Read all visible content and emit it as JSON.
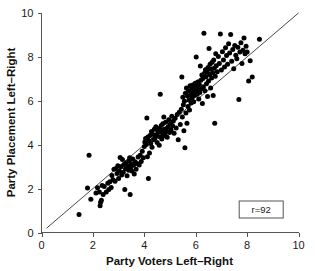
{
  "chart_data": {
    "type": "scatter",
    "title": "",
    "xlabel": "Party Voters Left–Right",
    "ylabel": "Party Placement Left–Right",
    "xlim": [
      0,
      10
    ],
    "ylim": [
      0,
      10
    ],
    "xticks": [
      0,
      2,
      4,
      6,
      8,
      10
    ],
    "yticks": [
      0,
      2,
      4,
      6,
      8,
      10
    ],
    "xtick_labels": [
      "0",
      "2",
      "4",
      "6",
      "8",
      "10"
    ],
    "ytick_labels": [
      "0",
      "2",
      "4",
      "6",
      "8",
      "10"
    ],
    "grid": false,
    "legend": null,
    "annotations": [
      {
        "name": "correlation-box",
        "text": "r=92",
        "x": 8.55,
        "y": 1.05,
        "boxed": true
      }
    ],
    "reference_line": {
      "type": "identity",
      "description": "45-degree diagonal reference line y = x",
      "x_start": 0.2,
      "y_start": 0.2,
      "x_end": 10.0,
      "y_end": 10.0
    },
    "marker": {
      "shape": "circle",
      "color": "#000000",
      "size_px": 5
    },
    "n_points": 214,
    "points": [
      [
        1.46,
        0.82
      ],
      [
        1.79,
        2.03
      ],
      [
        1.85,
        3.52
      ],
      [
        1.92,
        1.52
      ],
      [
        2.12,
        1.8
      ],
      [
        2.18,
        2.04
      ],
      [
        2.25,
        1.84
      ],
      [
        2.28,
        1.22
      ],
      [
        2.3,
        1.38
      ],
      [
        2.33,
        1.47
      ],
      [
        2.36,
        2.14
      ],
      [
        2.4,
        1.73
      ],
      [
        2.44,
        2.09
      ],
      [
        2.52,
        1.85
      ],
      [
        2.58,
        2.24
      ],
      [
        2.62,
        1.96
      ],
      [
        2.66,
        2.31
      ],
      [
        2.71,
        2.05
      ],
      [
        2.74,
        2.6
      ],
      [
        2.78,
        2.4
      ],
      [
        2.82,
        2.88
      ],
      [
        2.86,
        2.34
      ],
      [
        2.9,
        2.92
      ],
      [
        2.94,
        2.69
      ],
      [
        2.97,
        3.04
      ],
      [
        3.0,
        2.46
      ],
      [
        3.03,
        2.8
      ],
      [
        3.06,
        3.42
      ],
      [
        3.09,
        3.0
      ],
      [
        3.12,
        2.62
      ],
      [
        3.15,
        3.33
      ],
      [
        3.18,
        2.74
      ],
      [
        3.21,
        3.1
      ],
      [
        3.24,
        1.96
      ],
      [
        3.27,
        2.91
      ],
      [
        3.3,
        3.18
      ],
      [
        3.33,
        2.58
      ],
      [
        3.36,
        3.02
      ],
      [
        3.39,
        2.84
      ],
      [
        3.41,
        3.27
      ],
      [
        3.43,
        3.4
      ],
      [
        3.45,
        1.73
      ],
      [
        3.47,
        2.96
      ],
      [
        3.49,
        3.12
      ],
      [
        3.52,
        2.8
      ],
      [
        3.55,
        3.35
      ],
      [
        3.58,
        3.06
      ],
      [
        3.61,
        2.66
      ],
      [
        3.64,
        3.22
      ],
      [
        3.68,
        2.88
      ],
      [
        3.72,
        3.14
      ],
      [
        3.76,
        3.44
      ],
      [
        3.8,
        3.08
      ],
      [
        3.84,
        3.52
      ],
      [
        3.88,
        3.24
      ],
      [
        3.92,
        3.7
      ],
      [
        3.96,
        3.4
      ],
      [
        4.0,
        3.92
      ],
      [
        4.02,
        4.12
      ],
      [
        4.05,
        4.28
      ],
      [
        4.08,
        4.01
      ],
      [
        4.1,
        5.22
      ],
      [
        4.12,
        3.45
      ],
      [
        4.14,
        4.35
      ],
      [
        4.16,
        2.46
      ],
      [
        4.18,
        4.18
      ],
      [
        4.2,
        3.62
      ],
      [
        4.22,
        4.42
      ],
      [
        4.25,
        4.05
      ],
      [
        4.28,
        4.6
      ],
      [
        4.3,
        3.88
      ],
      [
        4.33,
        4.48
      ],
      [
        4.36,
        4.22
      ],
      [
        4.39,
        4.7
      ],
      [
        4.42,
        4.3
      ],
      [
        4.45,
        4.82
      ],
      [
        4.48,
        4.44
      ],
      [
        4.5,
        4.1
      ],
      [
        4.53,
        4.58
      ],
      [
        4.56,
        4.74
      ],
      [
        4.58,
        3.98
      ],
      [
        4.6,
        4.36
      ],
      [
        4.62,
        6.3
      ],
      [
        4.64,
        4.66
      ],
      [
        4.66,
        4.88
      ],
      [
        4.68,
        4.26
      ],
      [
        4.7,
        4.54
      ],
      [
        4.72,
        4.96
      ],
      [
        4.74,
        4.4
      ],
      [
        4.76,
        5.26
      ],
      [
        4.78,
        4.7
      ],
      [
        4.8,
        4.48
      ],
      [
        4.83,
        5.02
      ],
      [
        4.86,
        4.62
      ],
      [
        4.89,
        4.34
      ],
      [
        4.92,
        4.8
      ],
      [
        4.95,
        5.14
      ],
      [
        4.98,
        4.56
      ],
      [
        5.01,
        4.94
      ],
      [
        5.04,
        4.68
      ],
      [
        5.07,
        5.3
      ],
      [
        5.1,
        4.86
      ],
      [
        5.13,
        5.08
      ],
      [
        5.16,
        4.52
      ],
      [
        5.2,
        5.2
      ],
      [
        5.24,
        4.76
      ],
      [
        5.28,
        5.38
      ],
      [
        5.32,
        4.22
      ],
      [
        5.36,
        5.48
      ],
      [
        5.4,
        4.92
      ],
      [
        5.44,
        5.62
      ],
      [
        5.46,
        7.08
      ],
      [
        5.48,
        5.26
      ],
      [
        5.5,
        6.16
      ],
      [
        5.52,
        5.82
      ],
      [
        5.54,
        4.64
      ],
      [
        5.56,
        5.98
      ],
      [
        5.58,
        3.86
      ],
      [
        5.6,
        6.34
      ],
      [
        5.62,
        5.44
      ],
      [
        5.64,
        6.58
      ],
      [
        5.66,
        4.98
      ],
      [
        5.68,
        6.22
      ],
      [
        5.7,
        5.74
      ],
      [
        5.72,
        6.46
      ],
      [
        5.74,
        6.04
      ],
      [
        5.76,
        5.58
      ],
      [
        5.78,
        6.68
      ],
      [
        5.8,
        6.28
      ],
      [
        5.82,
        5.9
      ],
      [
        5.84,
        6.52
      ],
      [
        5.86,
        6.12
      ],
      [
        5.88,
        6.72
      ],
      [
        5.9,
        6.38
      ],
      [
        5.92,
        5.96
      ],
      [
        5.94,
        6.6
      ],
      [
        5.96,
        6.24
      ],
      [
        5.98,
        6.8
      ],
      [
        6.0,
        6.44
      ],
      [
        6.02,
        8.0
      ],
      [
        6.04,
        6.66
      ],
      [
        6.06,
        6.3
      ],
      [
        6.08,
        6.86
      ],
      [
        6.1,
        6.5
      ],
      [
        6.12,
        6.08
      ],
      [
        6.14,
        6.74
      ],
      [
        6.16,
        6.38
      ],
      [
        6.18,
        7.58
      ],
      [
        6.2,
        6.94
      ],
      [
        6.22,
        6.56
      ],
      [
        6.24,
        7.18
      ],
      [
        6.26,
        5.88
      ],
      [
        6.28,
        7.02
      ],
      [
        6.3,
        6.64
      ],
      [
        6.32,
        9.08
      ],
      [
        6.34,
        7.26
      ],
      [
        6.36,
        6.46
      ],
      [
        6.38,
        7.42
      ],
      [
        6.4,
        7.1
      ],
      [
        6.42,
        6.78
      ],
      [
        6.44,
        7.34
      ],
      [
        6.46,
        6.2
      ],
      [
        6.48,
        7.52
      ],
      [
        6.5,
        6.9
      ],
      [
        6.52,
        8.38
      ],
      [
        6.54,
        7.2
      ],
      [
        6.56,
        7.66
      ],
      [
        6.58,
        6.58
      ],
      [
        6.6,
        7.44
      ],
      [
        6.62,
        7.04
      ],
      [
        6.64,
        7.76
      ],
      [
        6.66,
        7.28
      ],
      [
        6.68,
        6.24
      ],
      [
        6.7,
        7.86
      ],
      [
        6.72,
        7.48
      ],
      [
        6.74,
        4.98
      ],
      [
        6.76,
        7.12
      ],
      [
        6.78,
        8.14
      ],
      [
        6.8,
        7.6
      ],
      [
        6.84,
        7.32
      ],
      [
        6.88,
        8.02
      ],
      [
        6.92,
        7.7
      ],
      [
        6.96,
        9.04
      ],
      [
        7.0,
        7.4
      ],
      [
        7.04,
        8.24
      ],
      [
        7.08,
        7.86
      ],
      [
        7.12,
        7.54
      ],
      [
        7.16,
        8.42
      ],
      [
        7.2,
        8.06
      ],
      [
        7.24,
        7.66
      ],
      [
        7.28,
        8.6
      ],
      [
        7.32,
        8.18
      ],
      [
        7.36,
        9.02
      ],
      [
        7.4,
        7.8
      ],
      [
        7.44,
        8.34
      ],
      [
        7.48,
        7.46
      ],
      [
        7.52,
        8.52
      ],
      [
        7.56,
        8.08
      ],
      [
        7.6,
        7.92
      ],
      [
        7.64,
        8.44
      ],
      [
        7.68,
        6.06
      ],
      [
        7.72,
        8.22
      ],
      [
        7.76,
        8.64
      ],
      [
        7.8,
        7.7
      ],
      [
        7.84,
        8.3
      ],
      [
        7.88,
        8.86
      ],
      [
        7.92,
        8.14
      ],
      [
        7.96,
        8.48
      ],
      [
        8.0,
        8.22
      ],
      [
        8.06,
        6.9
      ],
      [
        8.12,
        7.82
      ],
      [
        8.2,
        7.08
      ],
      [
        8.48,
        8.8
      ]
    ]
  }
}
